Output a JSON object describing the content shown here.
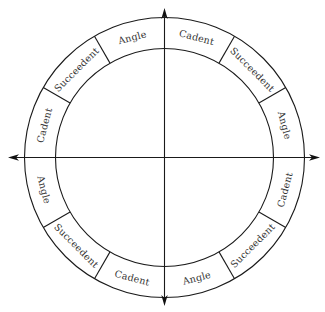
{
  "diagram": {
    "type": "house-wheel",
    "center": [
      164.5,
      157.5
    ],
    "outer_radius": 140,
    "inner_radius": 109,
    "axis_extent": {
      "left": 8,
      "right": 320,
      "top": 8,
      "bottom": 306
    },
    "colors": {
      "line": "#1a1a1a",
      "text": "#333333",
      "background": "#ffffff"
    },
    "houses": [
      {
        "label": "Angle",
        "start_deg": 0,
        "end_deg": 30
      },
      {
        "label": "Succeedent",
        "start_deg": 30,
        "end_deg": 60
      },
      {
        "label": "Cadent",
        "start_deg": 60,
        "end_deg": 90
      },
      {
        "label": "Angle",
        "start_deg": 90,
        "end_deg": 120
      },
      {
        "label": "Succeedent",
        "start_deg": 120,
        "end_deg": 150
      },
      {
        "label": "Cadent",
        "start_deg": 150,
        "end_deg": 180
      },
      {
        "label": "Angle",
        "start_deg": 180,
        "end_deg": 210
      },
      {
        "label": "Succeedent",
        "start_deg": 210,
        "end_deg": 240
      },
      {
        "label": "Cadent",
        "start_deg": 240,
        "end_deg": 270
      },
      {
        "label": "Angle",
        "start_deg": 270,
        "end_deg": 300
      },
      {
        "label": "Succeedent",
        "start_deg": 300,
        "end_deg": 330
      },
      {
        "label": "Cadent",
        "start_deg": 330,
        "end_deg": 360
      }
    ],
    "axes": [
      {
        "name": "horizontal",
        "arrows": [
          "left",
          "right"
        ]
      },
      {
        "name": "vertical",
        "arrows": [
          "up",
          "down"
        ]
      }
    ]
  }
}
